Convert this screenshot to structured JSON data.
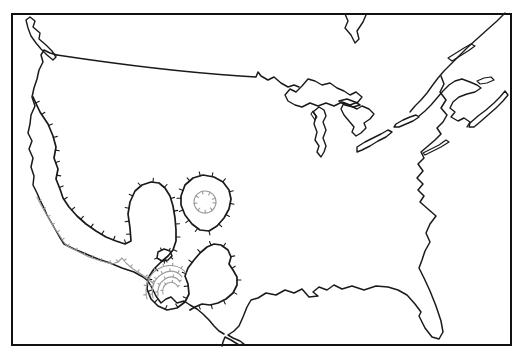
{
  "canvas": {
    "width": 524,
    "height": 359,
    "background": "#ffffff"
  },
  "colors": {
    "border": "#111111",
    "dark": "#1a1a1a",
    "light": "#9b9b9b"
  },
  "map": {
    "frame": {
      "x": 12,
      "y": 14,
      "width": 499,
      "height": 331,
      "stroke": "border",
      "strokeWidth": 2
    },
    "features": [
      {
        "name": "vancouver-island",
        "type": "island",
        "stroke": "dark",
        "width": 1.4,
        "closed": true,
        "ticks": null,
        "d": "M30,17 L35,21 L33,27 L40,33 L39,39 L46,45 L52,51 L56,57 L53,60 L47,55 L41,49 L36,43 L31,36 L28,28 L26,20"
      },
      {
        "name": "canada-us-border",
        "type": "border-line",
        "stroke": "dark",
        "width": 1.5,
        "closed": false,
        "ticks": null,
        "d": "M57,55 C110,63 180,72 240,76 L256,77 L258,72 L261,76 L268,80 L274,77 L281,83 L288,87 L294,85 L299,87"
      },
      {
        "name": "pacific-coast-and-mexico-border",
        "type": "coastline",
        "stroke": "dark",
        "width": 1.5,
        "closed": false,
        "ticks": null,
        "d": "M57,55 L50,53 L44,50 L41,55 L43,62 L39,70 L37,79 L34,88 L32,97 L35,106 L31,115 L30,124 L28,133 L32,141 L29,149 L33,158 L31,167 L34,176 L33,185 L37,193 L40,200 L44,208 L47,215 L51,222 L55,229 L59,236 L64,244 L74,249 L86,254 L98,259 L110,263 L122,268 L134,272 L143,277 L148,281 L152,288 L156,296 L161,303 L166,299 L171,297 L177,303 L184,301 L190,305 L197,309 L203,314 L209,320 L214,326 L219,331 L224,334"
      },
      {
        "name": "james-bay",
        "type": "coastline",
        "stroke": "dark",
        "width": 1.4,
        "closed": false,
        "ticks": null,
        "d": "M345,14 L348,21 L345,28 L351,35 L355,43 L359,39 L357,31 L363,22 L366,15"
      },
      {
        "name": "lake-superior",
        "type": "lake",
        "stroke": "dark",
        "width": 1.4,
        "closed": true,
        "ticks": null,
        "d": "M285,95 L290,89 L296,92 L302,86 L308,79 L315,81 L322,85 L330,83 L337,88 L344,91 L350,95 L356,92 L362,97 L358,102 L350,105 L342,102 L334,106 L326,103 L318,106 L310,103 L302,107 L295,105 L288,101"
      },
      {
        "name": "manitoulin-island",
        "type": "island",
        "stroke": "dark",
        "width": 1.6,
        "closed": true,
        "ticks": null,
        "d": "M339,101 L347,99 L355,102 L360,105 L353,107 L345,105"
      },
      {
        "name": "lake-michigan",
        "type": "lake",
        "stroke": "dark",
        "width": 1.4,
        "closed": true,
        "ticks": null,
        "d": "M319,107 L324,110 L326,116 L323,122 L326,130 L323,138 L326,146 L324,152 L321,157 L317,152 L319,146 L315,140 L317,132 L314,124 L316,116 L313,112"
      },
      {
        "name": "green-bay",
        "type": "lake",
        "stroke": "dark",
        "width": 1.1,
        "closed": true,
        "ticks": null,
        "d": "M313,111 L317,117 L315,120 L311,114"
      },
      {
        "name": "lake-huron",
        "type": "lake",
        "stroke": "dark",
        "width": 1.4,
        "closed": true,
        "ticks": null,
        "d": "M344,103 L351,106 L357,109 L362,106 L369,109 L374,114 L370,119 L364,123 L366,128 L361,133 L356,136 L352,132 L354,127 L349,121 L344,115 L341,109"
      },
      {
        "name": "lake-erie",
        "type": "lake",
        "stroke": "dark",
        "width": 1.4,
        "closed": true,
        "ticks": null,
        "d": "M357,147 L365,142 L373,138 L381,134 L388,130 L392,132 L386,137 L378,141 L370,146 L362,150 L357,152"
      },
      {
        "name": "lake-ontario",
        "type": "lake",
        "stroke": "dark",
        "width": 1.4,
        "closed": true,
        "ticks": null,
        "d": "M396,124 L403,120 L410,117 L416,115 L419,117 L413,121 L406,124 L399,127 L394,127"
      },
      {
        "name": "st-lawrence-north-shore",
        "type": "coastline",
        "stroke": "dark",
        "width": 1.4,
        "closed": false,
        "ticks": null,
        "d": "M505,13 L497,21 L488,29 L478,38 L468,47 L459,56 L451,64 L444,71 L438,78 L432,86 L427,93 L421,100 L415,106 L410,112"
      },
      {
        "name": "gaspe-new-brunswick-coast",
        "type": "coastline",
        "stroke": "dark",
        "width": 1.4,
        "closed": false,
        "ticks": null,
        "d": "M419,116 L425,111 L431,105 L437,98 L443,91 L449,85 L455,81 L462,79 L470,82 L477,85 L481,88 L475,92 L467,94 L459,97 L453,102 L450,108 L455,112 L451,117 L458,121 L464,118 L470,122 L467,127"
      },
      {
        "name": "nova-scotia",
        "type": "island",
        "stroke": "dark",
        "width": 1.4,
        "closed": true,
        "ticks": null,
        "d": "M470,123 L478,116 L486,110 L494,103 L500,97 L505,91 L508,95 L503,101 L496,108 L488,115 L480,122 L474,127 L469,127"
      },
      {
        "name": "prince-edward-island",
        "type": "island",
        "stroke": "dark",
        "width": 1.2,
        "closed": true,
        "ticks": null,
        "d": "M477,81 L484,78 L491,77 L494,80 L487,83 L480,84"
      },
      {
        "name": "anticosti-island",
        "type": "island",
        "stroke": "dark",
        "width": 1.2,
        "closed": true,
        "ticks": null,
        "d": "M448,58 L456,53 L464,48 L471,44 L475,46 L468,51 L460,56 L452,61"
      },
      {
        "name": "long-island",
        "type": "island",
        "stroke": "dark",
        "width": 1.2,
        "closed": true,
        "ticks": null,
        "d": "M423,153 L431,149 L439,145 L446,140 L449,142 L441,147 L433,151 L425,155"
      },
      {
        "name": "atlantic-and-gulf-coast",
        "type": "coastline",
        "stroke": "dark",
        "width": 1.5,
        "closed": false,
        "ticks": null,
        "d": "M441,76 L444,84 L440,92 L446,100 L441,108 L447,115 L443,122 L437,128 L441,134 L435,140 L428,146 L421,152 L424,158 L418,164 L423,171 L417,178 L423,184 L418,190 L424,196 L420,202 L428,209 L436,216 L430,224 L426,233 L430,242 L425,251 L422,260 L419,268 L424,278 L430,291 L436,306 L441,321 L443,332 L439,339 L432,337 L425,328 L419,316 L421,312 L415,304 L407,295 L398,290 L388,287 L376,286 L364,290 L352,286 L342,289 L334,285 L327,290 L319,287 L313,292 L318,296 L309,297 L302,289 L294,293 L285,290 L276,295 L266,293 L258,298 L251,300 L247,307 L243,317 L239,326 L234,331 L228,335 L233,338 L240,341 L244,344 L239,345 L231,340 L225,337 L223,342 L222,346"
      },
      {
        "name": "contour-main-hachured",
        "type": "contour",
        "stroke": "dark",
        "width": 1.7,
        "closed": false,
        "ticks": {
          "spacing": 13,
          "len": 4,
          "side": 1
        },
        "d": "M33,97 L40,112 L48,124 L53,136 L56,147 L54,158 L58,169 L56,179 L60,189 L63,198 L69,207 L77,216 L86,224 L96,231 L106,237 L116,241 L125,244 L131,241 L130,228 L128,214 L130,202 L135,191 L142,185 L151,182 L159,183 L165,188 L170,196 L173,206 L175,218 L176,230 L176,241 L173,250 L168,256 L161,262 L154,269 L148,278 L147,289 L151,299 L158,306 L167,310 L177,308 L185,302 L189,294 L188,284 L185,276 L188,268 L194,260 L200,253 L207,247 L214,244 L221,245 L228,250 L231,257 L229,264 L233,270 L237,277 L237,285 L233,293 L226,299 L218,303 L210,305 L202,304 L195,307 L190,310"
      },
      {
        "name": "contour-small-closed-loop",
        "type": "contour",
        "stroke": "dark",
        "width": 1.5,
        "closed": true,
        "ticks": {
          "spacing": 8,
          "len": 2.5,
          "side": 1
        },
        "d": "M158,252 L164,249 L170,251 L172,256 L168,260 L162,261 L157,258"
      },
      {
        "name": "contour-central-closed-blob",
        "type": "contour",
        "stroke": "dark",
        "width": 1.7,
        "closed": true,
        "ticks": {
          "spacing": 12,
          "len": 4,
          "side": 1
        },
        "d": "M181,196 L185,185 L193,178 L203,175 L214,177 L223,182 L229,190 L231,199 L229,209 L224,218 L217,226 L209,231 L200,230 L192,224 L185,215 L181,205"
      },
      {
        "name": "contour-inner-circle",
        "type": "contour",
        "stroke": "light",
        "width": 1.1,
        "closed": false,
        "ticks": {
          "spacing": 8,
          "len": 3,
          "side": 1
        },
        "d": "M216,202 A11,11 0 1 0 194,202 A11,11 0 1 0 216,202"
      },
      {
        "name": "contour-gray-coastal",
        "type": "contour",
        "stroke": "light",
        "width": 1.1,
        "closed": false,
        "ticks": {
          "spacing": 9,
          "len": 2.5,
          "side": 1
        },
        "d": "M37,197 L41,205 L45,212 L49,219 L53,226 L58,233 L63,241 L67,246 L77,251 L89,257 L101,261 L112,264 L118,262 L122,258 L126,263 L133,269 L141,274 L148,279 L154,284"
      },
      {
        "name": "contour-nested-arc-1",
        "type": "contour",
        "stroke": "light",
        "width": 1.1,
        "closed": false,
        "ticks": {
          "spacing": 9,
          "len": 2.5,
          "side": 1
        },
        "d": "M147,299 C144,287 148,275 158,269 C168,263 180,265 186,273"
      },
      {
        "name": "contour-nested-arc-2",
        "type": "contour",
        "stroke": "light",
        "width": 1.1,
        "closed": false,
        "ticks": {
          "spacing": 8,
          "len": 2.5,
          "side": 1
        },
        "d": "M153,298 C151,288 154,279 162,274 C170,269 178,271 182,277"
      },
      {
        "name": "contour-nested-arc-3",
        "type": "contour",
        "stroke": "light",
        "width": 1.1,
        "closed": false,
        "ticks": {
          "spacing": 8,
          "len": 2.2,
          "side": 1
        },
        "d": "M158,296 C157,289 159,283 165,279 C171,275 177,277 180,282"
      },
      {
        "name": "contour-nested-arc-4",
        "type": "contour",
        "stroke": "light",
        "width": 1.1,
        "closed": false,
        "ticks": {
          "spacing": 7,
          "len": 2,
          "side": 1
        },
        "d": "M163,294 C162,289 164,285 168,283 C172,281 176,283 178,287"
      }
    ]
  }
}
